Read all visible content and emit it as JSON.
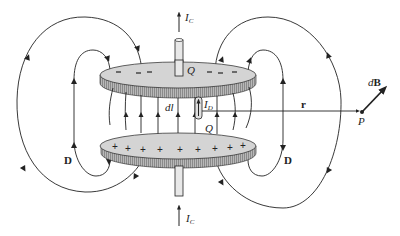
{
  "figure": {
    "labels": {
      "ic_top": {
        "main": "I",
        "sub": "C"
      },
      "ic_bottom": {
        "main": "I",
        "sub": "C"
      },
      "q_top": "Q",
      "q_bottom": "Q",
      "dl": "dl",
      "id": {
        "main": "I",
        "sub": "D"
      },
      "r": "r",
      "db": {
        "prefix": "d",
        "main": "B"
      },
      "p": "P",
      "d_left": "D",
      "d_right": "D"
    },
    "top_plate_charges": [
      "−",
      "−",
      "−",
      "−",
      "−",
      "−"
    ],
    "bottom_plate_charges": [
      "+",
      "+",
      "+",
      "+",
      "+",
      "+",
      "+",
      "+",
      "+"
    ],
    "colors": {
      "plate_face": "#d4d4d4",
      "plate_edge": "#9a9a9a",
      "line": "#222222",
      "background": "#ffffff"
    }
  }
}
